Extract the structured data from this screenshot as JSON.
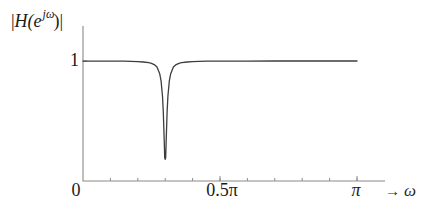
{
  "figure": {
    "background": "#ffffff",
    "axis_color": "#8a8a8a",
    "tick_color": "#8a8a8a",
    "curve_color": "#3d3d3d",
    "text_color": "#1a1a1a"
  },
  "labels": {
    "ylabel_bar_open": "|",
    "ylabel_H": "H",
    "ylabel_paren_e": "(e",
    "ylabel_sup": "jω",
    "ylabel_close": ")|",
    "y_tick_1": "1",
    "x_tick_0": "0",
    "x_tick_half_pi": "0.5π",
    "x_tick_pi": "π",
    "x_arrow": "→",
    "x_var": "ω"
  },
  "chart_data": {
    "type": "line",
    "title": "",
    "xlabel": "ω",
    "ylabel": "|H(e^jω)|",
    "x_unit": "π radians",
    "xlim": [
      0,
      1.1
    ],
    "ylim": [
      0,
      1.29
    ],
    "grid": false,
    "legend": "none",
    "x_major_ticks": [
      {
        "value": 0,
        "label": "0"
      },
      {
        "value": 0.5,
        "label": "0.5π"
      },
      {
        "value": 1,
        "label": "π"
      }
    ],
    "x_minor_tick_step": 0.1,
    "y_ticks": [
      {
        "value": 1,
        "label": "1"
      }
    ],
    "notch_frequency_over_pi": 0.3,
    "notch_min_value": 0.18,
    "passband_value": 1,
    "series": [
      {
        "name": "|H(e^jω)|",
        "points": [
          [
            0,
            0.999
          ],
          [
            0.05,
            0.999
          ],
          [
            0.1,
            0.999
          ],
          [
            0.15,
            0.998
          ],
          [
            0.2,
            0.995
          ],
          [
            0.22,
            0.992
          ],
          [
            0.24,
            0.986
          ],
          [
            0.25,
            0.981
          ],
          [
            0.26,
            0.97
          ],
          [
            0.27,
            0.949
          ],
          [
            0.28,
            0.894
          ],
          [
            0.285,
            0.832
          ],
          [
            0.29,
            0.707
          ],
          [
            0.293,
            0.573
          ],
          [
            0.295,
            0.447
          ],
          [
            0.297,
            0.287
          ],
          [
            0.298,
            0.196
          ],
          [
            0.3,
            0.18
          ],
          [
            0.302,
            0.196
          ],
          [
            0.303,
            0.287
          ],
          [
            0.305,
            0.447
          ],
          [
            0.307,
            0.573
          ],
          [
            0.31,
            0.707
          ],
          [
            0.315,
            0.832
          ],
          [
            0.32,
            0.894
          ],
          [
            0.33,
            0.949
          ],
          [
            0.34,
            0.97
          ],
          [
            0.35,
            0.981
          ],
          [
            0.36,
            0.986
          ],
          [
            0.38,
            0.992
          ],
          [
            0.4,
            0.995
          ],
          [
            0.45,
            0.998
          ],
          [
            0.5,
            0.999
          ],
          [
            0.6,
            0.999
          ],
          [
            0.7,
            1
          ],
          [
            0.8,
            1
          ],
          [
            0.9,
            1
          ],
          [
            1,
            1
          ]
        ]
      }
    ]
  }
}
